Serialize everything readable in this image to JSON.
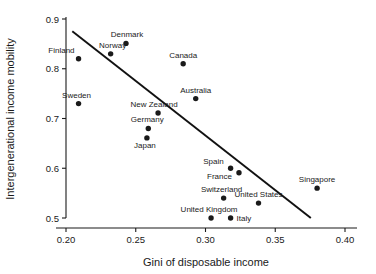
{
  "chart_data": {
    "type": "scatter",
    "title": "",
    "xlabel": "Gini of disposable income",
    "ylabel": "Intergenerational income mobility",
    "xlim": [
      0.2,
      0.4
    ],
    "ylim": [
      0.5,
      0.9
    ],
    "xticks": [
      "0.20",
      "0.25",
      "0.30",
      "0.35",
      "0.40"
    ],
    "yticks": [
      "0.5",
      "0.6",
      "0.7",
      "0.8",
      "0.9"
    ],
    "grid": false,
    "legend": "none",
    "points": [
      {
        "label": "Finland",
        "x": 0.209,
        "y": 0.82,
        "label_dx": -4,
        "label_dy": -6,
        "anchor": "end"
      },
      {
        "label": "Norway",
        "x": 0.232,
        "y": 0.83,
        "label_dx": 2,
        "label_dy": -6,
        "anchor": "middle"
      },
      {
        "label": "Denmark",
        "x": 0.243,
        "y": 0.851,
        "label_dx": 1,
        "label_dy": -6,
        "anchor": "middle"
      },
      {
        "label": "Canada",
        "x": 0.284,
        "y": 0.81,
        "label_dx": 0,
        "label_dy": -6,
        "anchor": "middle"
      },
      {
        "label": "Sweden",
        "x": 0.209,
        "y": 0.73,
        "label_dx": -2,
        "label_dy": -6,
        "anchor": "middle"
      },
      {
        "label": "Australia",
        "x": 0.293,
        "y": 0.74,
        "label_dx": 0,
        "label_dy": -6,
        "anchor": "middle"
      },
      {
        "label": "New Zealand",
        "x": 0.266,
        "y": 0.711,
        "label_dx": -4,
        "label_dy": -6,
        "anchor": "middle"
      },
      {
        "label": "Germany",
        "x": 0.259,
        "y": 0.68,
        "label_dx": -1,
        "label_dy": -6,
        "anchor": "middle"
      },
      {
        "label": "Japan",
        "x": 0.258,
        "y": 0.661,
        "label_dx": -2,
        "label_dy": 10,
        "anchor": "middle"
      },
      {
        "label": "Spain",
        "x": 0.318,
        "y": 0.6,
        "label_dx": -7,
        "label_dy": -4,
        "anchor": "end"
      },
      {
        "label": "France",
        "x": 0.324,
        "y": 0.591,
        "label_dx": -7,
        "label_dy": 6,
        "anchor": "end"
      },
      {
        "label": "Switzerland",
        "x": 0.313,
        "y": 0.54,
        "label_dx": -2,
        "label_dy": -6,
        "anchor": "middle"
      },
      {
        "label": "United States",
        "x": 0.338,
        "y": 0.53,
        "label_dx": 0,
        "label_dy": -6,
        "anchor": "middle"
      },
      {
        "label": "Singapore",
        "x": 0.38,
        "y": 0.56,
        "label_dx": 0,
        "label_dy": -6,
        "anchor": "middle"
      },
      {
        "label": "United Kingdom",
        "x": 0.304,
        "y": 0.5,
        "label_dx": -2,
        "label_dy": -6,
        "anchor": "middle"
      },
      {
        "label": "Italy",
        "x": 0.318,
        "y": 0.5,
        "label_dx": 6,
        "label_dy": 3,
        "anchor": "start"
      }
    ],
    "trend_line": {
      "x_start": 0.2045,
      "y_start": 0.8755,
      "x_end": 0.3755,
      "y_end": 0.5,
      "color": "#111111"
    }
  },
  "colors": {
    "axis": "#1a1a1a",
    "point": "#1a1a1a",
    "background": "#ffffff"
  }
}
